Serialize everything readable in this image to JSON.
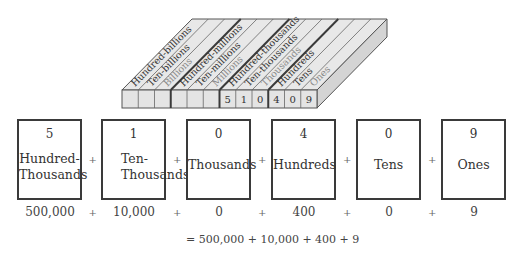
{
  "place_value_block": {
    "columns": [
      {
        "label": "Hundred-billions",
        "digit": ""
      },
      {
        "label": "Ten-billions",
        "digit": ""
      },
      {
        "label": "Billions",
        "digit": ""
      },
      {
        "label": "Hundred-millions",
        "digit": ""
      },
      {
        "label": "Ten-millions",
        "digit": ""
      },
      {
        "label": "Millions",
        "digit": ""
      },
      {
        "label": "Hundred-thousands",
        "digit": "5"
      },
      {
        "label": "Ten-thousands",
        "digit": "1"
      },
      {
        "label": "Thousands",
        "digit": "0"
      },
      {
        "label": "Hundreds",
        "digit": "4"
      },
      {
        "label": "Tens",
        "digit": "0"
      },
      {
        "label": "Ones",
        "digit": "9"
      }
    ],
    "colors": {
      "face": "#e6e6e6",
      "side": "#d2d2d2",
      "edge": "#555555",
      "thick_divider": "#3a3a3a"
    }
  },
  "expanded": {
    "boxes": [
      {
        "digit": "5",
        "place_line1": "Hundred-",
        "place_line2": "Thousands",
        "value": "500,000"
      },
      {
        "digit": "1",
        "place_line1": "Ten-",
        "place_line2": "Thousands",
        "value": "10,000"
      },
      {
        "digit": "0",
        "place_line1": "Thousands",
        "place_line2": "",
        "value": "0"
      },
      {
        "digit": "4",
        "place_line1": "Hundreds",
        "place_line2": "",
        "value": "400"
      },
      {
        "digit": "0",
        "place_line1": "Tens",
        "place_line2": "",
        "value": "0"
      },
      {
        "digit": "9",
        "place_line1": "Ones",
        "place_line2": "",
        "value": "9"
      }
    ],
    "operator": "+"
  },
  "equation": "= 500,000 + 10,000 + 400 + 9"
}
